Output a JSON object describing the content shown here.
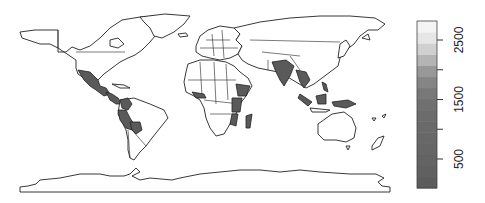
{
  "map": {
    "type": "choropleth-world",
    "projection": "equirectangular",
    "highlight_color": "#5a5a5a",
    "outline_color": "#222222",
    "highlighted_regions": [
      "Mexico",
      "Guatemala",
      "Honduras",
      "Nicaragua",
      "Colombia",
      "Ecuador",
      "Peru",
      "Bolivia",
      "Sierra Leone",
      "Liberia",
      "Ghana",
      "Cameroon",
      "Ethiopia",
      "Somalia",
      "Kenya",
      "Tanzania",
      "Malawi",
      "Mozambique",
      "Madagascar",
      "Zimbabwe",
      "India",
      "Nepal",
      "Bangladesh",
      "Myanmar",
      "Thailand",
      "Cambodia",
      "Vietnam",
      "Laos",
      "Philippines",
      "Malaysia",
      "Indonesia",
      "Papua New Guinea"
    ]
  },
  "legend": {
    "type": "grayscale-colorbar",
    "min": 0,
    "max": 2800,
    "ticks": [
      {
        "value": 500,
        "label": "500"
      },
      {
        "value": 1000,
        "label": ""
      },
      {
        "value": 1500,
        "label": "1500"
      },
      {
        "value": 2000,
        "label": ""
      },
      {
        "value": 2500,
        "label": "2500"
      }
    ],
    "segments": [
      "#5c5c5c",
      "#606060",
      "#636363",
      "#666666",
      "#686868",
      "#6a6a6a",
      "#6c6c6c",
      "#707070",
      "#787878",
      "#858585",
      "#989898",
      "#b4b4b4",
      "#d0d0d0",
      "#e6e6e6",
      "#f4f4f4"
    ]
  }
}
